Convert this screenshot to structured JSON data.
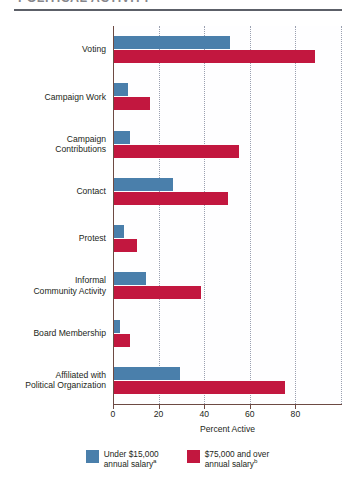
{
  "figure": {
    "title": "POLITICAL ACTIVITY",
    "xaxis_title": "Percent Active"
  },
  "legend": {
    "items": [
      {
        "label_line1": "Under $15,000",
        "label_line2": "annual salary",
        "note": "a",
        "color": "#4a7fab",
        "key": "low"
      },
      {
        "label_line1": "$75,000 and over",
        "label_line2": "annual salary",
        "note": "b",
        "color": "#c2173f",
        "key": "high"
      }
    ]
  },
  "chart_data": {
    "type": "bar",
    "orientation": "horizontal",
    "title": "POLITICAL ACTIVITY",
    "xlabel": "Percent Active",
    "ylabel": "",
    "xlim": [
      0,
      100
    ],
    "xticks": [
      0,
      20,
      40,
      60,
      80
    ],
    "xtick_labels": [
      "0",
      "20",
      "40",
      "60",
      "80"
    ],
    "grid": "vertical-dotted",
    "legend_position": "bottom-center",
    "categories": [
      "Voting",
      "Campaign Work",
      "Campaign Contributions",
      "Contact",
      "Protest",
      "Informal Community Activity",
      "Board Membership",
      "Affiliated with Political Organization"
    ],
    "category_lines": [
      [
        "Voting"
      ],
      [
        "Campaign Work"
      ],
      [
        "Campaign",
        "Contributions"
      ],
      [
        "Contact"
      ],
      [
        "Protest"
      ],
      [
        "Informal",
        "Community Activity"
      ],
      [
        "Board Membership"
      ],
      [
        "Affiliated with",
        "Political Organization"
      ]
    ],
    "series": [
      {
        "name": "Under $15,000 annual salary",
        "color": "#4a7fab",
        "values": [
          51,
          6,
          7,
          26,
          4.5,
          14,
          2.5,
          29
        ]
      },
      {
        "name": "$75,000 and over annual salary",
        "color": "#c2173f",
        "values": [
          88,
          16,
          55,
          50,
          10,
          38,
          7,
          75
        ]
      }
    ]
  }
}
